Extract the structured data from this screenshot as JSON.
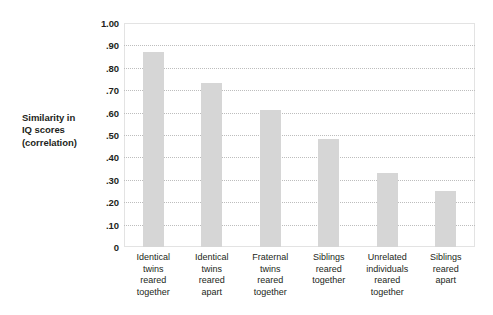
{
  "chart_data": {
    "type": "bar",
    "title": "",
    "subtitle": "",
    "xlabel": "",
    "ylabel": "Similarity in IQ scores (correlation)",
    "ylabel_lines": [
      "Similarity in",
      "IQ scores",
      "(correlation)"
    ],
    "categories": [
      "Identical twins reared together",
      "Identical twins reared apart",
      "Fraternal twins reared together",
      "Siblings reared together",
      "Unrelated individuals reared together",
      "Siblings reared apart"
    ],
    "category_lines": [
      [
        "Identical",
        "twins",
        "reared",
        "together"
      ],
      [
        "Identical",
        "twins",
        "reared",
        "apart"
      ],
      [
        "Fraternal",
        "twins",
        "reared",
        "together"
      ],
      [
        "Siblings",
        "reared",
        "together"
      ],
      [
        "Unrelated",
        "individuals",
        "reared",
        "together"
      ],
      [
        "Siblings",
        "reared",
        "apart"
      ]
    ],
    "values": [
      0.87,
      0.73,
      0.61,
      0.48,
      0.33,
      0.25
    ],
    "ylim": [
      0,
      1.0
    ],
    "yticks": [
      1.0,
      0.9,
      0.8,
      0.7,
      0.6,
      0.5,
      0.4,
      0.3,
      0.2,
      0.1,
      0
    ],
    "ytick_labels": [
      "1.00",
      ".90",
      ".80",
      ".70",
      ".60",
      ".50",
      ".40",
      ".30",
      ".20",
      ".10",
      "0"
    ],
    "grid": true,
    "grid_style": "dotted",
    "grid_color": "#bdbdbd",
    "legend": false,
    "legend_position": "none",
    "bar_color": "#d6d6d6",
    "frame_color": "#e3e3e3",
    "text_color": "#231f20",
    "background_color": "#ffffff"
  }
}
